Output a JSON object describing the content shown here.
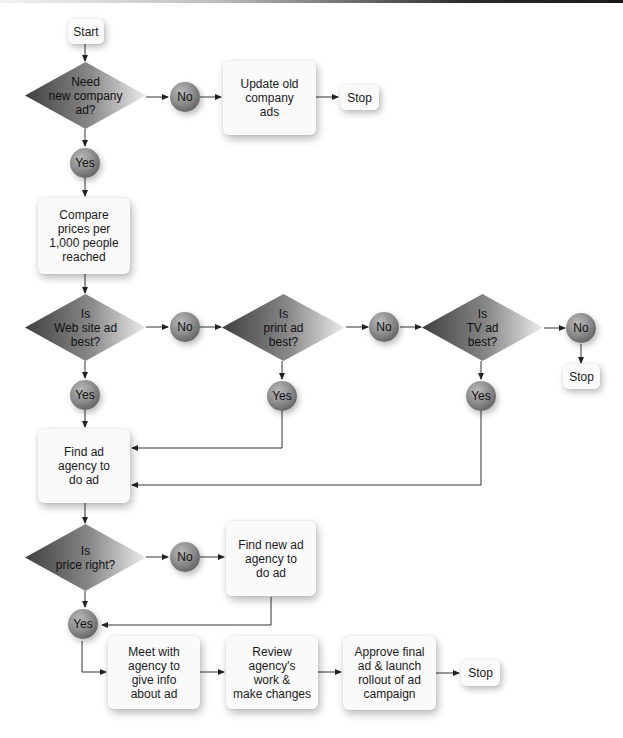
{
  "flowchart": {
    "start": "Start",
    "decision_new_ad": [
      "Need",
      "new company",
      "ad?"
    ],
    "no_1": "No",
    "update_old_ads": [
      "Update old",
      "company",
      "ads"
    ],
    "stop_1": "Stop",
    "yes_1": "Yes",
    "compare_prices": [
      "Compare",
      "prices per",
      "1,000 people",
      "reached"
    ],
    "decision_web": [
      "Is",
      "Web site ad",
      "best?"
    ],
    "no_web": "No",
    "decision_print": [
      "Is",
      "print ad",
      "best?"
    ],
    "no_print": "No",
    "decision_tv": [
      "Is",
      "TV ad",
      "best?"
    ],
    "no_tv": "No",
    "stop_tv": "Stop",
    "yes_web": "Yes",
    "yes_print": "Yes",
    "yes_tv": "Yes",
    "find_agency": [
      "Find ad",
      "agency to",
      "do ad"
    ],
    "decision_price": [
      "Is",
      "price right?"
    ],
    "no_price": "No",
    "find_new_agency": [
      "Find new ad",
      "agency to",
      "do ad"
    ],
    "yes_price": "Yes",
    "meet_agency": [
      "Meet with",
      "agency to",
      "give info",
      "about ad"
    ],
    "review_work": [
      "Review",
      "agency's",
      "work &",
      "make changes"
    ],
    "approve_final": [
      "Approve final",
      "ad & launch",
      "rollout of ad",
      "campaign"
    ],
    "stop_final": "Stop"
  },
  "colors": {
    "diamond_dark": "#4a4a4a",
    "diamond_light": "#e6e6e6",
    "box_fill": "#fafafa",
    "connector": "#222222"
  }
}
